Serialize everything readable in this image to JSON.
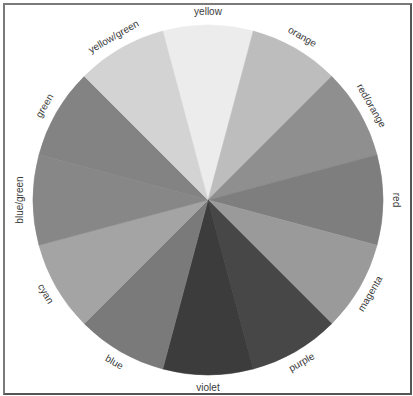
{
  "diagram": {
    "type": "color-wheel",
    "center": [
      208,
      200
    ],
    "radius": 175,
    "label_radius": 188,
    "segments": [
      {
        "label": "yellow",
        "start": -105,
        "end": -75,
        "fill": "#ececec"
      },
      {
        "label": "orange",
        "start": -75,
        "end": -45,
        "fill": "#bdbdbd"
      },
      {
        "label": "red/orange",
        "start": -45,
        "end": -15,
        "fill": "#8f8f8f"
      },
      {
        "label": "red",
        "start": -15,
        "end": 15,
        "fill": "#7e7e7e"
      },
      {
        "label": "magenta",
        "start": 15,
        "end": 45,
        "fill": "#9a9a9a"
      },
      {
        "label": "purple",
        "start": 45,
        "end": 75,
        "fill": "#474747"
      },
      {
        "label": "violet",
        "start": 75,
        "end": 105,
        "fill": "#3c3c3c"
      },
      {
        "label": "blue",
        "start": 105,
        "end": 135,
        "fill": "#7a7a7a"
      },
      {
        "label": "cyan",
        "start": 135,
        "end": 165,
        "fill": "#a4a4a4"
      },
      {
        "label": "blue/green",
        "start": 165,
        "end": 195,
        "fill": "#878787"
      },
      {
        "label": "green",
        "start": 195,
        "end": 225,
        "fill": "#838383"
      },
      {
        "label": "yellow/green",
        "start": 225,
        "end": 255,
        "fill": "#d3d3d3"
      }
    ]
  }
}
